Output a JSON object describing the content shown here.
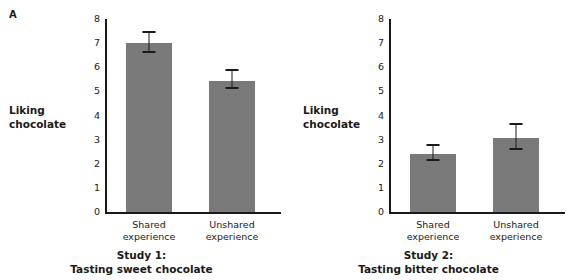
{
  "panel_letter": "A",
  "chart_data": [
    {
      "type": "bar",
      "panel": "left",
      "title": "Study 1:",
      "subtitle": "Tasting sweet chocolate",
      "ylabel_line1": "Liking",
      "ylabel_line2": "chocolate",
      "xlabel": "",
      "ylim": [
        0,
        8
      ],
      "yticks": [
        "8",
        "7",
        "6",
        "5",
        "4",
        "3",
        "2",
        "1",
        "0"
      ],
      "grid": false,
      "legend": "none",
      "categories": [
        "Shared\nexperience",
        "Unshared\nexperience"
      ],
      "category_lines": [
        [
          "Shared",
          "experience"
        ],
        [
          "Unshared",
          "experience"
        ]
      ],
      "values": [
        7.0,
        5.45
      ],
      "errors_low": [
        6.6,
        5.1
      ],
      "errors_high": [
        7.4,
        5.85
      ],
      "bar_color": "#7a7a7a"
    },
    {
      "type": "bar",
      "panel": "right",
      "title": "Study 2:",
      "subtitle": "Tasting bitter chocolate",
      "ylabel_line1": "Liking",
      "ylabel_line2": "chocolate",
      "xlabel": "",
      "ylim": [
        0,
        8
      ],
      "yticks": [
        "8",
        "7",
        "6",
        "5",
        "4",
        "3",
        "2",
        "1",
        "0"
      ],
      "grid": false,
      "legend": "none",
      "categories": [
        "Shared\nexperience",
        "Unshared\nexperience"
      ],
      "category_lines": [
        [
          "Shared",
          "experience"
        ],
        [
          "Unshared",
          "experience"
        ]
      ],
      "values": [
        2.4,
        3.05
      ],
      "errors_low": [
        2.1,
        2.55
      ],
      "errors_high": [
        2.75,
        3.6
      ],
      "bar_color": "#7a7a7a"
    }
  ]
}
